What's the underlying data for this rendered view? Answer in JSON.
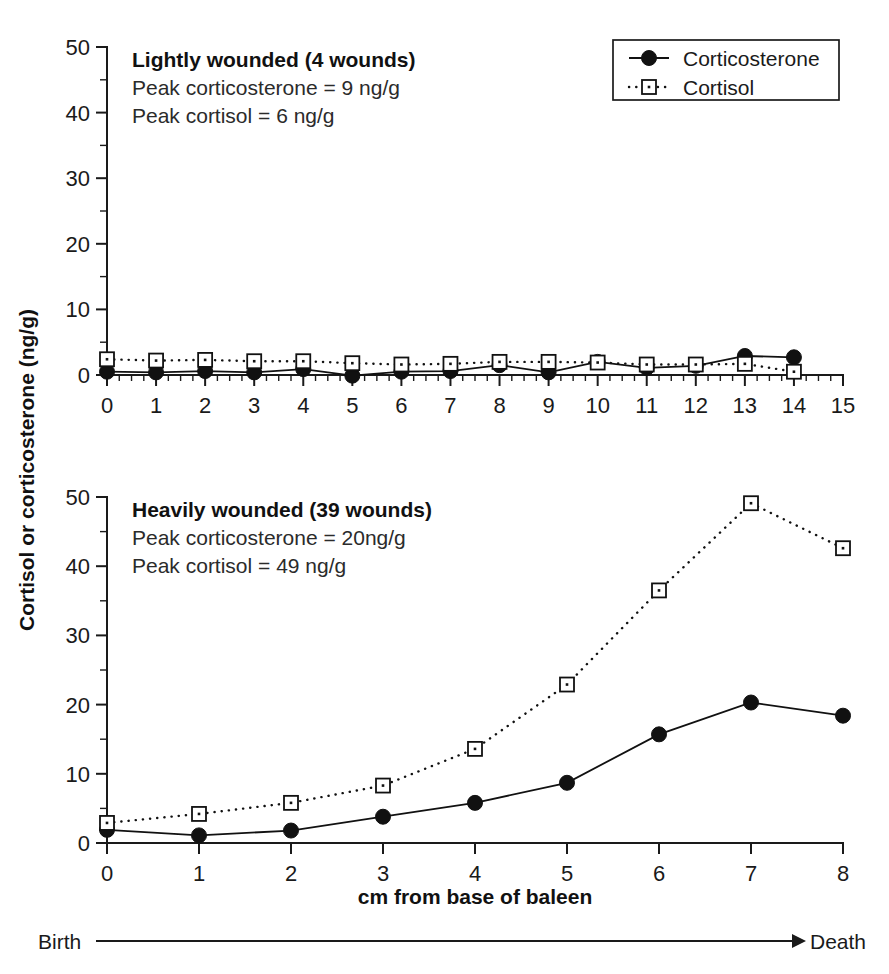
{
  "figure": {
    "y_axis_title": "Cortisol or corticosterone (ng/g)",
    "x_axis_title": "cm from base of baleen",
    "timeline": {
      "start_label": "Birth",
      "end_label": "Death",
      "arrow_icon": "right-arrow-icon"
    },
    "legend": {
      "position": "top-right",
      "entries": [
        {
          "label": "Corticosterone",
          "marker": "filled-circle",
          "line": "solid"
        },
        {
          "label": "Cortisol",
          "marker": "open-square",
          "line": "dotted"
        }
      ]
    },
    "colors": {
      "ink": "#111111",
      "axis": "#1a1a1a",
      "background": "#ffffff"
    }
  },
  "chart_data": [
    {
      "id": "lightly-wounded",
      "type": "line",
      "title": "Lightly wounded (4 wounds)",
      "annotations": [
        "Peak corticosterone = 9 ng/g",
        "Peak cortisol = 6 ng/g"
      ],
      "xlabel": "",
      "ylabel": "Cortisol or corticosterone (ng/g)",
      "xlim": [
        0,
        15
      ],
      "ylim": [
        0,
        50
      ],
      "xticks": [
        0,
        1,
        2,
        3,
        4,
        5,
        6,
        7,
        8,
        9,
        10,
        11,
        12,
        13,
        14,
        15
      ],
      "yticks": [
        0,
        10,
        20,
        30,
        40,
        50
      ],
      "y_minor_step": 5,
      "x_minor_step": 0.25,
      "grid": false,
      "x": [
        0,
        1,
        2,
        3,
        4,
        5,
        6,
        7,
        8,
        9,
        10,
        11,
        12,
        13,
        14
      ],
      "series": [
        {
          "name": "Corticosterone",
          "marker": "filled-circle",
          "line": "solid",
          "values": [
            0.5,
            0.4,
            0.6,
            0.4,
            0.9,
            -0.1,
            0.5,
            0.6,
            1.5,
            0.4,
            2.0,
            1.1,
            1.4,
            2.9,
            2.7
          ]
        },
        {
          "name": "Cortisol",
          "marker": "open-square",
          "line": "dotted",
          "values": [
            2.4,
            2.2,
            2.3,
            2.1,
            2.1,
            1.8,
            1.6,
            1.7,
            2.0,
            2.0,
            1.9,
            1.6,
            1.6,
            1.7,
            0.5
          ]
        }
      ]
    },
    {
      "id": "heavily-wounded",
      "type": "line",
      "title": "Heavily wounded (39 wounds)",
      "annotations": [
        "Peak corticosterone = 20ng/g",
        "Peak cortisol = 49 ng/g"
      ],
      "xlabel": "cm from base of baleen",
      "ylabel": "Cortisol or corticosterone (ng/g)",
      "xlim": [
        0,
        8
      ],
      "ylim": [
        0,
        50
      ],
      "xticks": [
        0,
        1,
        2,
        3,
        4,
        5,
        6,
        7,
        8
      ],
      "yticks": [
        0,
        10,
        20,
        30,
        40,
        50
      ],
      "y_minor_step": 5,
      "x_minor_step": 1,
      "grid": false,
      "x": [
        0,
        1,
        2,
        3,
        4,
        5,
        6,
        7,
        8
      ],
      "series": [
        {
          "name": "Corticosterone",
          "marker": "filled-circle",
          "line": "solid",
          "values": [
            1.9,
            1.1,
            1.8,
            3.8,
            5.8,
            8.7,
            15.7,
            20.3,
            18.4
          ]
        },
        {
          "name": "Cortisol",
          "marker": "open-square",
          "line": "dotted",
          "values": [
            2.9,
            4.2,
            5.8,
            8.3,
            13.6,
            22.9,
            36.5,
            49.1,
            42.6
          ]
        }
      ]
    }
  ]
}
